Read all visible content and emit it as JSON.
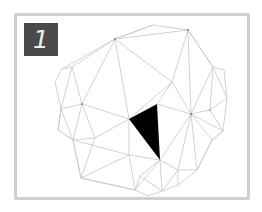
{
  "panel": {
    "label": "1",
    "border_color": "#cfcfcf",
    "badge_color": "#4a4a4a"
  },
  "mesh": {
    "edge_color": "#c8c8c8",
    "highlight_color": "#000000",
    "highlighted_triangle": [
      [
        129,
        119
      ],
      [
        157,
        104
      ],
      [
        160,
        160
      ]
    ]
  }
}
